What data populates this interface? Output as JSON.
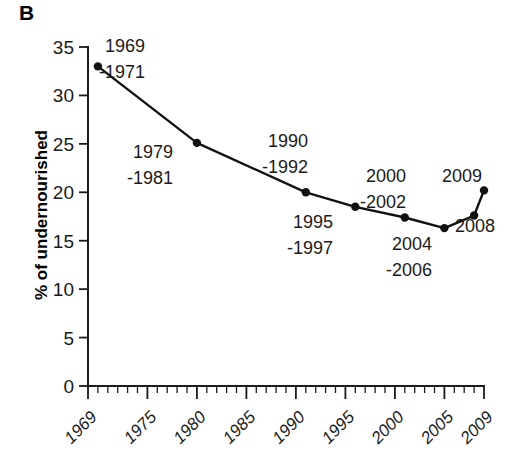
{
  "panel": {
    "letter": "B"
  },
  "chart_data": {
    "type": "line",
    "title": "",
    "subtitle": "",
    "xlabel": "",
    "ylabel": "% of undernourished",
    "xlim": [
      1969,
      2009
    ],
    "ylim": [
      0,
      35
    ],
    "grid": false,
    "legend": "none",
    "y_ticks": [
      0,
      5,
      10,
      15,
      20,
      25,
      30,
      35
    ],
    "y_tick_labels": [
      "0",
      "5",
      "10",
      "15",
      "20",
      "25",
      "30",
      "35"
    ],
    "x_ticks": [
      1969,
      1975,
      1980,
      1985,
      1990,
      1995,
      2000,
      2005,
      2009
    ],
    "x_tick_labels": [
      "1969",
      "1975",
      "1980",
      "1985",
      "1990",
      "1995",
      "2000",
      "2005",
      "2009"
    ],
    "x_minor_tick_step": 1,
    "x": [
      1970,
      1980,
      1991,
      1996,
      2001,
      2005,
      2008,
      2009
    ],
    "values": [
      33.0,
      25.1,
      20.0,
      18.5,
      17.4,
      16.3,
      17.6,
      20.2
    ],
    "point_labels": [
      "1969\n-1971",
      "1979\n-1981",
      "1990\n-1992",
      "1995\n-1997",
      "2000\n-2002",
      "2004\n-2006",
      "2008",
      "2009"
    ],
    "series": [
      {
        "name": "% of undernourished",
        "color": "#111111",
        "marker": "circle",
        "values": [
          33.0,
          25.1,
          20.0,
          18.5,
          17.4,
          16.3,
          17.6,
          20.2
        ]
      }
    ]
  },
  "annotations": [
    {
      "line1": "1969",
      "line2": "-1971",
      "x": 105,
      "y": 52
    },
    {
      "line1": "1979",
      "line2": "-1981",
      "x": 133,
      "y": 158
    },
    {
      "line1": "1990",
      "line2": "-1992",
      "x": 268,
      "y": 147
    },
    {
      "line1": "1995",
      "line2": "-1997",
      "x": 293,
      "y": 228
    },
    {
      "line1": "2000",
      "line2": "-2002",
      "x": 366,
      "y": 182
    },
    {
      "line1": "2004",
      "line2": "-2006",
      "x": 392,
      "y": 250
    },
    {
      "line1": "2009",
      "line2": "",
      "x": 442,
      "y": 182
    },
    {
      "line1": "2008",
      "line2": "",
      "x": 455,
      "y": 232
    }
  ],
  "colors": {
    "background": "#ffffff",
    "ink": "#111111",
    "axis": "#1a1a1a"
  }
}
